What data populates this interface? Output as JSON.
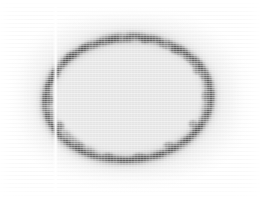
{
  "figure": {
    "width_px": 260,
    "height_px": 197,
    "modality": "grayscale scan / autoradiograph-like image",
    "background_color": "#e5e5e5",
    "page_color": "#ffffff",
    "ring_color": "#6e6e6e",
    "ring_dark_color": "#4a4a4a",
    "streak_color": "#ffffff",
    "texture": "horizontal scanlines",
    "caption": "",
    "labels": [],
    "annotations": []
  },
  "field": {
    "name": "scan-field",
    "fill": "#e5e5e5",
    "vignette": "white feathered edges",
    "inset_left_px": 14,
    "inset_top_px": 12,
    "inset_right_px": 248,
    "inset_bottom_px": 186
  },
  "ring": {
    "name": "ellipse-ring",
    "shape": "ellipse",
    "center_x": 128,
    "center_y": 99,
    "radius_x": 83,
    "radius_y": 61,
    "stroke_width_px": 7,
    "stroke_color": "#767676",
    "opacity": 0.85,
    "rotation_deg": -4,
    "bounds": {
      "left": 45,
      "top": 38,
      "right": 211,
      "bottom": 160
    }
  },
  "artifact": {
    "name": "vertical-streak",
    "type": "vertical light streak",
    "x_px": 56,
    "y_top_px": 6,
    "y_bottom_px": 192,
    "width_px": 5,
    "color": "#ffffff"
  },
  "chart_data": {
    "type": "heatmap",
    "xlabel": "",
    "ylabel": "",
    "grid": false,
    "legend": "none",
    "xlim": [
      0,
      260
    ],
    "ylim": [
      0,
      197
    ],
    "intensity_scale": {
      "min": 0.0,
      "max": 1.0,
      "colormap": "gray"
    },
    "features": [
      {
        "name": "page-background",
        "intensity": 1.0,
        "region": "outer margin"
      },
      {
        "name": "scan-field",
        "intensity": 0.9,
        "region": "x 14-248, y 12-186"
      },
      {
        "name": "ring-stroke",
        "intensity": 0.46,
        "region": "ellipse cx 128 cy 99 rx 83 ry 61"
      },
      {
        "name": "ring-interior",
        "intensity": 0.91,
        "region": "inside ellipse"
      },
      {
        "name": "vertical-streak",
        "intensity": 1.0,
        "region": "x 56, y 6-192"
      }
    ],
    "ring_trace": [
      {
        "x": 62,
        "y": 56
      },
      {
        "x": 78,
        "y": 46
      },
      {
        "x": 98,
        "y": 40
      },
      {
        "x": 122,
        "y": 37
      },
      {
        "x": 148,
        "y": 39
      },
      {
        "x": 172,
        "y": 47
      },
      {
        "x": 192,
        "y": 58
      },
      {
        "x": 205,
        "y": 74
      },
      {
        "x": 210,
        "y": 92
      },
      {
        "x": 206,
        "y": 110
      },
      {
        "x": 196,
        "y": 127
      },
      {
        "x": 180,
        "y": 141
      },
      {
        "x": 160,
        "y": 152
      },
      {
        "x": 136,
        "y": 159
      },
      {
        "x": 110,
        "y": 159
      },
      {
        "x": 86,
        "y": 153
      },
      {
        "x": 66,
        "y": 142
      },
      {
        "x": 52,
        "y": 126
      },
      {
        "x": 46,
        "y": 107
      },
      {
        "x": 47,
        "y": 88
      },
      {
        "x": 53,
        "y": 70
      }
    ]
  }
}
